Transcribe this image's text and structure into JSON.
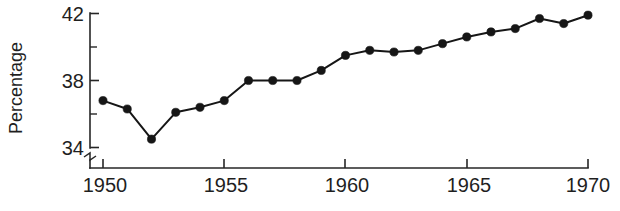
{
  "chart_data": {
    "type": "line",
    "title": "",
    "subtitle": "",
    "xlabel": "",
    "ylabel": "Percentage",
    "x": [
      1950,
      1951,
      1952,
      1953,
      1954,
      1955,
      1956,
      1957,
      1958,
      1959,
      1960,
      1961,
      1962,
      1963,
      1964,
      1965,
      1966,
      1967,
      1968,
      1969,
      1970
    ],
    "values": [
      36.8,
      36.3,
      34.5,
      36.1,
      36.4,
      36.8,
      38.0,
      38.0,
      38.0,
      38.6,
      39.5,
      39.8,
      39.7,
      39.8,
      40.2,
      40.6,
      40.9,
      41.1,
      41.7,
      41.4,
      41.9
    ],
    "series": [
      {
        "name": "Percentage",
        "values": [
          36.8,
          36.3,
          34.5,
          36.1,
          36.4,
          36.8,
          38.0,
          38.0,
          38.0,
          38.6,
          39.5,
          39.8,
          39.7,
          39.8,
          40.2,
          40.6,
          40.9,
          41.1,
          41.7,
          41.4,
          41.9
        ]
      }
    ],
    "xlim": [
      1950,
      1970
    ],
    "ylim": [
      34,
      42
    ],
    "y_axis_broken": true,
    "y_break_below": 34,
    "grid": false,
    "legend": false,
    "legend_position": "none",
    "marker": "filled-circle",
    "line_color": "#161616",
    "marker_color": "#161616",
    "axis_color": "#262626",
    "background_color": "#ffffff",
    "y_ticks_major": [
      34,
      38,
      42
    ],
    "y_ticks_major_labels": [
      "34",
      "38",
      "42"
    ],
    "y_ticks_minor": [
      36,
      40
    ],
    "x_ticks_major": [
      1950,
      1955,
      1960,
      1965,
      1970
    ],
    "x_ticks_major_labels": [
      "1950",
      "1955",
      "1960",
      "1965",
      "1970"
    ]
  }
}
